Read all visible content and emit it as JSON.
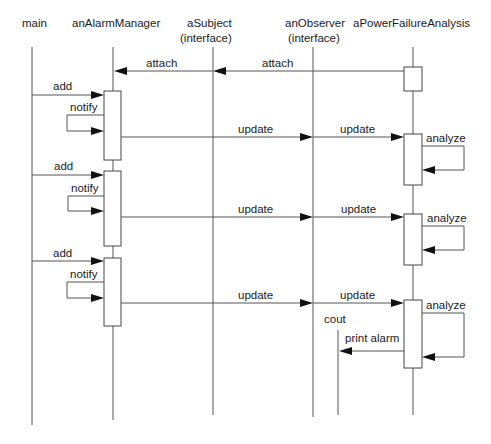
{
  "diagram": {
    "type": "sequence",
    "lifelines": [
      {
        "id": "main",
        "label": "main",
        "sub": "",
        "x": 32,
        "label_x": 22
      },
      {
        "id": "anAlarmManager",
        "label": "anAlarmManager",
        "sub": "",
        "x": 113,
        "label_x": 72
      },
      {
        "id": "aSubject",
        "label": "aSubject",
        "sub": "(interface)",
        "x": 213,
        "label_x": 187
      },
      {
        "id": "anObserver",
        "label": "anObserver",
        "sub": "(interface)",
        "x": 313,
        "label_x": 285
      },
      {
        "id": "aPowerFailureAnalysis",
        "label": "aPowerFailureAnalysis",
        "sub": "",
        "x": 413,
        "label_x": 353
      },
      {
        "id": "cout",
        "label": "cout",
        "sub": "",
        "x": 338,
        "label_x": 324
      }
    ],
    "messages": [
      {
        "label": "attach",
        "from": "aPowerFailureAnalysis",
        "to": "aSubject"
      },
      {
        "label": "attach",
        "from": "aSubject",
        "to": "anAlarmManager"
      },
      {
        "label": "add",
        "from": "main",
        "to": "anAlarmManager"
      },
      {
        "label": "notify",
        "from": "anAlarmManager",
        "to": "anAlarmManager"
      },
      {
        "label": "update",
        "from": "anAlarmManager",
        "to": "anObserver"
      },
      {
        "label": "update",
        "from": "anObserver",
        "to": "aPowerFailureAnalysis"
      },
      {
        "label": "analyze",
        "from": "aPowerFailureAnalysis",
        "to": "aPowerFailureAnalysis"
      },
      {
        "label": "add",
        "from": "main",
        "to": "anAlarmManager"
      },
      {
        "label": "notify",
        "from": "anAlarmManager",
        "to": "anAlarmManager"
      },
      {
        "label": "update",
        "from": "anAlarmManager",
        "to": "anObserver"
      },
      {
        "label": "update",
        "from": "anObserver",
        "to": "aPowerFailureAnalysis"
      },
      {
        "label": "analyze",
        "from": "aPowerFailureAnalysis",
        "to": "aPowerFailureAnalysis"
      },
      {
        "label": "add",
        "from": "main",
        "to": "anAlarmManager"
      },
      {
        "label": "notify",
        "from": "anAlarmManager",
        "to": "anAlarmManager"
      },
      {
        "label": "update",
        "from": "anAlarmManager",
        "to": "anObserver"
      },
      {
        "label": "update",
        "from": "anObserver",
        "to": "aPowerFailureAnalysis"
      },
      {
        "label": "analyze",
        "from": "aPowerFailureAnalysis",
        "to": "aPowerFailureAnalysis"
      },
      {
        "label": "print alarm",
        "from": "aPowerFailureAnalysis",
        "to": "cout"
      }
    ]
  },
  "labels": {
    "main": "main",
    "anAlarmManager": "anAlarmManager",
    "aSubject": "aSubject",
    "aSubject_sub": "(interface)",
    "anObserver": "anObserver",
    "anObserver_sub": "(interface)",
    "aPowerFailureAnalysis": "aPowerFailureAnalysis",
    "cout": "cout",
    "attach": "attach",
    "add": "add",
    "notify": "notify",
    "update": "update",
    "analyze": "analyze",
    "print_alarm": "print alarm"
  }
}
